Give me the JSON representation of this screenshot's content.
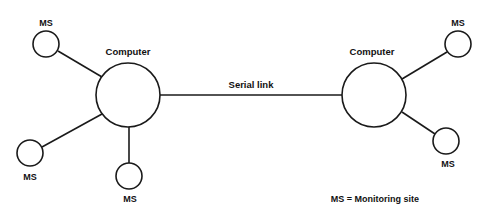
{
  "diagram": {
    "nodes": [
      {
        "id": "computer-left",
        "type": "computer",
        "label": "Computer"
      },
      {
        "id": "computer-right",
        "type": "computer",
        "label": "Computer"
      },
      {
        "id": "ms-left-top",
        "type": "monitoring-site",
        "label": "MS",
        "connected_to": "computer-left"
      },
      {
        "id": "ms-left-bottomleft",
        "type": "monitoring-site",
        "label": "MS",
        "connected_to": "computer-left"
      },
      {
        "id": "ms-left-bottom",
        "type": "monitoring-site",
        "label": "MS",
        "connected_to": "computer-left"
      },
      {
        "id": "ms-right-top",
        "type": "monitoring-site",
        "label": "MS",
        "connected_to": "computer-right"
      },
      {
        "id": "ms-right-bottom",
        "type": "monitoring-site",
        "label": "MS",
        "connected_to": "computer-right"
      }
    ],
    "links": [
      {
        "from": "computer-left",
        "to": "computer-right",
        "label": "Serial link"
      }
    ],
    "labels": {
      "computer_left": "Computer",
      "computer_right": "Computer",
      "serial_link": "Serial link",
      "ms": "MS",
      "legend": "MS = Monitoring site"
    }
  }
}
